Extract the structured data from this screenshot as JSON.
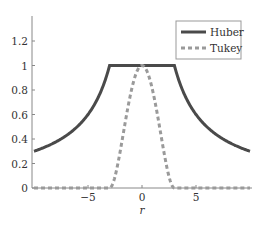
{
  "chart_data": {
    "type": "line",
    "title": "",
    "xlabel": "r",
    "ylabel": "",
    "xlim": [
      -10,
      10
    ],
    "ylim": [
      0,
      1.4
    ],
    "xticks": [
      -5,
      0,
      5
    ],
    "xtick_labels": [
      "−5",
      "0",
      "5"
    ],
    "yticks": [
      0,
      0.2,
      0.4,
      0.6,
      0.8,
      1,
      1.2
    ],
    "ytick_labels": [
      "0",
      "0.2",
      "0.4",
      "0.6",
      "0.8",
      "1",
      "1.2"
    ],
    "grid": false,
    "legend_position": "upper right",
    "series": [
      {
        "name": "Huber",
        "style": "solid",
        "color": "#4a4a4a",
        "formula": "w(r) = 1 if |r| <= 3 else 3/|r|",
        "x": [
          -10,
          -8,
          -6,
          -5,
          -4,
          -3,
          0,
          3,
          4,
          5,
          6,
          8,
          10
        ],
        "values": [
          0.3,
          0.375,
          0.5,
          0.6,
          0.75,
          1.0,
          1.0,
          1.0,
          0.75,
          0.6,
          0.5,
          0.375,
          0.3
        ]
      },
      {
        "name": "Tukey",
        "style": "dashed",
        "color": "#9a9a9a",
        "formula": "w(r) = (1 - (r/3)^2)^2 if |r| <= 3 else 0",
        "x": [
          -10,
          -3,
          -2,
          -1,
          0,
          1,
          2,
          3,
          10
        ],
        "values": [
          0,
          0,
          0.309,
          0.79,
          1.0,
          0.79,
          0.309,
          0,
          0
        ]
      }
    ]
  },
  "legend": {
    "items": [
      {
        "label": "Huber"
      },
      {
        "label": "Tukey"
      }
    ]
  },
  "axes": {
    "x_label": "r",
    "x_ticks": [
      "−5",
      "0",
      "5"
    ],
    "y_ticks": [
      "0",
      "0.2",
      "0.4",
      "0.6",
      "0.8",
      "1",
      "1.2"
    ]
  }
}
